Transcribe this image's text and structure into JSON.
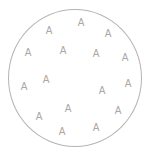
{
  "diagram": {
    "shape": "circle",
    "stroke_color": "#b4b4b4",
    "letter_color": "#a8a8a8",
    "letters": [
      {
        "text": "A",
        "x": 49,
        "y": 31
      },
      {
        "text": "A",
        "x": 81,
        "y": 23
      },
      {
        "text": "A",
        "x": 108,
        "y": 34
      },
      {
        "text": "A",
        "x": 28,
        "y": 53
      },
      {
        "text": "A",
        "x": 63,
        "y": 51
      },
      {
        "text": "A",
        "x": 96,
        "y": 54
      },
      {
        "text": "A",
        "x": 125,
        "y": 58
      },
      {
        "text": "A",
        "x": 24,
        "y": 87
      },
      {
        "text": "A",
        "x": 46,
        "y": 80
      },
      {
        "text": "A",
        "x": 102,
        "y": 91
      },
      {
        "text": "A",
        "x": 128,
        "y": 84
      },
      {
        "text": "A",
        "x": 39,
        "y": 117
      },
      {
        "text": "A",
        "x": 68,
        "y": 109
      },
      {
        "text": "A",
        "x": 118,
        "y": 111
      },
      {
        "text": "A",
        "x": 62,
        "y": 132
      },
      {
        "text": "A",
        "x": 96,
        "y": 128
      }
    ]
  }
}
